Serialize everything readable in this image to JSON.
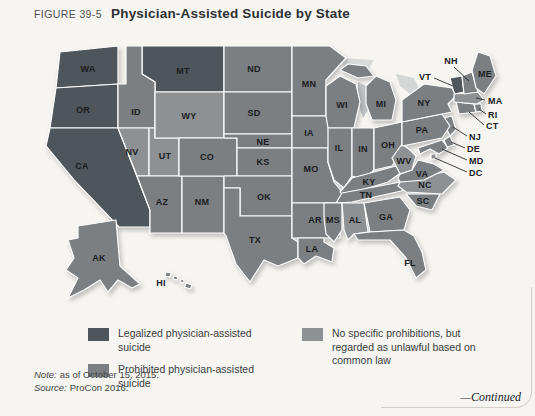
{
  "figure": {
    "label": "FIGURE 39-5",
    "title": "Physician-Assisted Suicide by State"
  },
  "colors": {
    "legalized": "#4e565c",
    "prohibited": "#7b7f82",
    "common": "#8d9194",
    "border": "#ffffff",
    "label": "#1a1c1e",
    "background": "#f6f5f2"
  },
  "legend": [
    {
      "key": "legalized",
      "label": "Legalized physician-assisted suicide"
    },
    {
      "key": "prohibited",
      "label": "Prohibited physician-assisted suicide"
    },
    {
      "key": "common",
      "label": "No specific prohibitions, but regarded as unlawful based on common law"
    }
  ],
  "map": {
    "states": [
      {
        "id": "WA",
        "category": "legalized"
      },
      {
        "id": "OR",
        "category": "legalized"
      },
      {
        "id": "CA",
        "category": "legalized"
      },
      {
        "id": "MT",
        "category": "legalized"
      },
      {
        "id": "VT",
        "category": "legalized"
      },
      {
        "id": "ID",
        "category": "prohibited"
      },
      {
        "id": "NV",
        "category": "common"
      },
      {
        "id": "UT",
        "category": "common"
      },
      {
        "id": "WY",
        "category": "common"
      },
      {
        "id": "AZ",
        "category": "prohibited"
      },
      {
        "id": "NM",
        "category": "prohibited"
      },
      {
        "id": "CO",
        "category": "prohibited"
      },
      {
        "id": "ND",
        "category": "prohibited"
      },
      {
        "id": "SD",
        "category": "prohibited"
      },
      {
        "id": "NE",
        "category": "prohibited"
      },
      {
        "id": "KS",
        "category": "prohibited"
      },
      {
        "id": "OK",
        "category": "prohibited"
      },
      {
        "id": "TX",
        "category": "prohibited"
      },
      {
        "id": "MN",
        "category": "prohibited"
      },
      {
        "id": "IA",
        "category": "prohibited"
      },
      {
        "id": "MO",
        "category": "prohibited"
      },
      {
        "id": "AR",
        "category": "prohibited"
      },
      {
        "id": "LA",
        "category": "prohibited"
      },
      {
        "id": "WI",
        "category": "prohibited"
      },
      {
        "id": "IL",
        "category": "prohibited"
      },
      {
        "id": "IN",
        "category": "prohibited"
      },
      {
        "id": "OH",
        "category": "prohibited"
      },
      {
        "id": "MI",
        "category": "prohibited"
      },
      {
        "id": "KY",
        "category": "prohibited"
      },
      {
        "id": "TN",
        "category": "prohibited"
      },
      {
        "id": "MS",
        "category": "prohibited"
      },
      {
        "id": "AL",
        "category": "common"
      },
      {
        "id": "GA",
        "category": "prohibited"
      },
      {
        "id": "SC",
        "category": "prohibited"
      },
      {
        "id": "FL",
        "category": "prohibited"
      },
      {
        "id": "NC",
        "category": "common"
      },
      {
        "id": "VA",
        "category": "prohibited"
      },
      {
        "id": "WV",
        "category": "common"
      },
      {
        "id": "MD",
        "category": "prohibited"
      },
      {
        "id": "DE",
        "category": "prohibited"
      },
      {
        "id": "NJ",
        "category": "prohibited"
      },
      {
        "id": "PA",
        "category": "prohibited"
      },
      {
        "id": "NY",
        "category": "prohibited"
      },
      {
        "id": "CT",
        "category": "prohibited"
      },
      {
        "id": "RI",
        "category": "prohibited"
      },
      {
        "id": "MA",
        "category": "common"
      },
      {
        "id": "NH",
        "category": "prohibited"
      },
      {
        "id": "ME",
        "category": "prohibited"
      },
      {
        "id": "DC",
        "category": "common"
      },
      {
        "id": "AK",
        "category": "prohibited"
      },
      {
        "id": "HI",
        "category": "prohibited"
      }
    ]
  },
  "notes": [
    {
      "prefix": "Note:",
      "text": "as of October 15, 2015."
    },
    {
      "prefix": "Source:",
      "text": "ProCon 2016."
    }
  ],
  "continued": "—Continued"
}
